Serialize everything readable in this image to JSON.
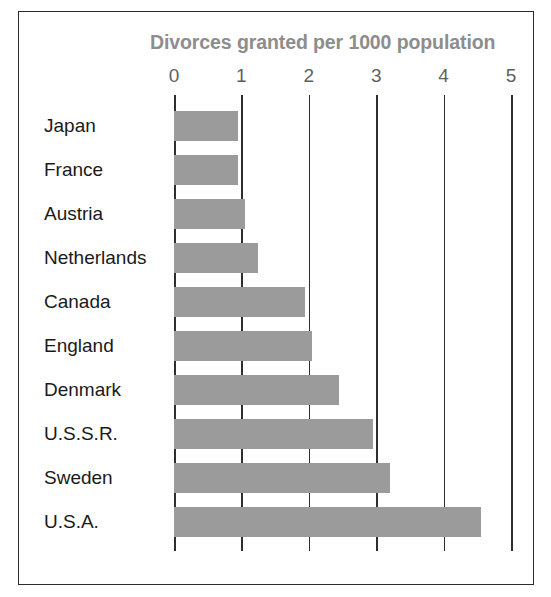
{
  "chart_data": {
    "type": "bar",
    "orientation": "horizontal",
    "title": "Divorces granted per 1000 population",
    "xlabel": "",
    "ylabel": "",
    "xlim": [
      0,
      5
    ],
    "xticks": [
      "0",
      "1",
      "2",
      "3",
      "4",
      "5"
    ],
    "grid": true,
    "legend": false,
    "bar_color": "#9b9b9b",
    "title_color": "#8d8d8d",
    "axis_color": "#2e2e2e",
    "categories": [
      "Japan",
      "France",
      "Austria",
      "Netherlands",
      "Canada",
      "England",
      "Denmark",
      "U.S.S.R.",
      "Sweden",
      "U.S.A."
    ],
    "values": [
      0.95,
      0.95,
      1.05,
      1.25,
      1.95,
      2.05,
      2.45,
      2.95,
      3.2,
      4.55
    ]
  }
}
